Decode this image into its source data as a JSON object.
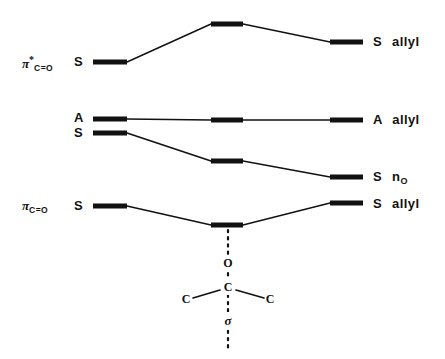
{
  "figure": {
    "type": "molecular-orbital-correlation-diagram",
    "background_color": "#ffffff",
    "line_color": "#111111",
    "width": 445,
    "height": 359
  },
  "left_labels": [
    {
      "id": "pi-star-co",
      "pi": "π",
      "star": "*",
      "sub": "C=O",
      "x": 22,
      "y": 55
    },
    {
      "id": "pi-co",
      "pi": "π",
      "star": "",
      "sub": "C=O",
      "x": 22,
      "y": 199
    }
  ],
  "symmetry_letters": [
    {
      "id": "sym-pi-star",
      "text": "S",
      "x": 74,
      "y": 55
    },
    {
      "id": "sym-a",
      "text": "A",
      "x": 74,
      "y": 111
    },
    {
      "id": "sym-s-no",
      "text": "S",
      "x": 74,
      "y": 126
    },
    {
      "id": "sym-pi",
      "text": "S",
      "x": 74,
      "y": 199
    }
  ],
  "right_labels": [
    {
      "id": "s-allyl-top",
      "sym": "S",
      "name": "allyl",
      "sub": "",
      "x": 373,
      "y": 35
    },
    {
      "id": "a-allyl",
      "sym": "A",
      "name": "allyl",
      "sub": "",
      "x": 373,
      "y": 113
    },
    {
      "id": "s-n-o",
      "sym": "S",
      "name": "n",
      "sub": "O",
      "x": 373,
      "y": 170
    },
    {
      "id": "s-allyl-bottom",
      "sym": "S",
      "name": "allyl",
      "sub": "",
      "x": 373,
      "y": 197
    }
  ],
  "columns": {
    "left": {
      "x1": 93,
      "x2": 127
    },
    "center": {
      "x1": 211,
      "x2": 243
    },
    "right": {
      "x1": 330,
      "x2": 363
    }
  },
  "correlation_lines": [
    {
      "id": "pi-star-co-to-s-allyl",
      "left_label": "π*(C=O) S",
      "right_label": "S allyl",
      "levels": [
        {
          "column": "left",
          "y": 62
        },
        {
          "column": "center",
          "y": 24
        },
        {
          "column": "right",
          "y": 42
        }
      ]
    },
    {
      "id": "a-to-a-allyl",
      "left_label": "A",
      "right_label": "A allyl",
      "levels": [
        {
          "column": "left",
          "y": 119
        },
        {
          "column": "center",
          "y": 120
        },
        {
          "column": "right",
          "y": 120
        }
      ]
    },
    {
      "id": "s-to-s-n-o",
      "left_label": "S",
      "right_label": "S n(O)",
      "levels": [
        {
          "column": "left",
          "y": 133
        },
        {
          "column": "center",
          "y": 161
        },
        {
          "column": "right",
          "y": 177
        }
      ]
    },
    {
      "id": "pi-co-to-s-allyl",
      "left_label": "π(C=O) S",
      "right_label": "S allyl",
      "levels": [
        {
          "column": "left",
          "y": 206
        },
        {
          "column": "center",
          "y": 225
        },
        {
          "column": "right",
          "y": 203
        }
      ]
    }
  ],
  "structure": {
    "dotted_axis_x": 228,
    "dotted_top_y": 230,
    "dotted_bottom_y": 350,
    "atoms": [
      {
        "id": "atom-o",
        "text": "O",
        "x": 228,
        "y": 263
      },
      {
        "id": "atom-c-center",
        "text": "C",
        "x": 228,
        "y": 287
      },
      {
        "id": "atom-c-left",
        "text": "C",
        "x": 186,
        "y": 299
      },
      {
        "id": "atom-c-right",
        "text": "C",
        "x": 270,
        "y": 299
      }
    ],
    "bonds": [
      {
        "id": "bond-c-cleft",
        "x1": 220,
        "y1": 290,
        "x2": 193,
        "y2": 298
      },
      {
        "id": "bond-c-cright",
        "x1": 236,
        "y1": 290,
        "x2": 264,
        "y2": 298
      }
    ],
    "sigma_label": {
      "id": "sigma",
      "text": "σ",
      "x": 228,
      "y": 320
    }
  }
}
